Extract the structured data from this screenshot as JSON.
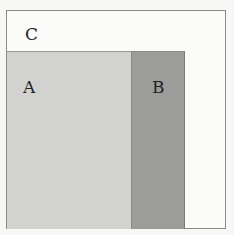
{
  "diagram": {
    "type": "region-partition",
    "regions": [
      {
        "id": "C",
        "label": "C",
        "role": "outer",
        "color": "#fbfbf9"
      },
      {
        "id": "A",
        "label": "A",
        "role": "inner-left",
        "color": "#d2d2d0"
      },
      {
        "id": "B",
        "label": "B",
        "role": "inner-right",
        "color": "#9c9c9a"
      }
    ],
    "colors": {
      "background": "#f7f7f5",
      "outer_border": "#8a8a8a"
    }
  }
}
